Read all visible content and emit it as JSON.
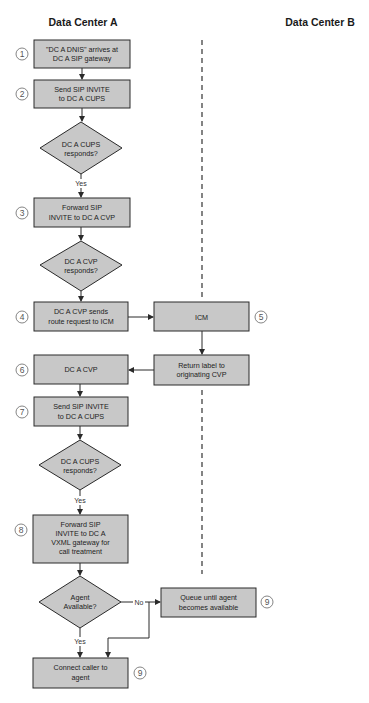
{
  "columns": {
    "left": "Data Center A",
    "right": "Data Center B"
  },
  "steps": [
    {
      "id": "s1",
      "number": "1",
      "type": "process",
      "lines": [
        "\"DC A DNIS\" arrives at",
        "DC A SIP gateway"
      ]
    },
    {
      "id": "s2",
      "number": "2",
      "type": "process",
      "lines": [
        "Send SIP INVITE",
        "to DC A CUPS"
      ]
    },
    {
      "id": "d1",
      "type": "decision",
      "lines": [
        "DC A CUPS",
        "responds?"
      ]
    },
    {
      "id": "s3",
      "number": "3",
      "type": "process",
      "lines": [
        "Forward SIP",
        "INVITE to DC A CVP"
      ]
    },
    {
      "id": "d2",
      "type": "decision",
      "lines": [
        "DC A CVP",
        "responds?"
      ]
    },
    {
      "id": "s4",
      "number": "4",
      "type": "process",
      "lines": [
        "DC A CVP sends",
        "route request to ICM"
      ]
    },
    {
      "id": "s5",
      "number": "5",
      "type": "process",
      "lines": [
        "ICM"
      ]
    },
    {
      "id": "s5b",
      "type": "process",
      "lines": [
        "Return label to",
        "originating CVP"
      ]
    },
    {
      "id": "s6",
      "number": "6",
      "type": "process",
      "lines": [
        "DC A CVP"
      ]
    },
    {
      "id": "s7",
      "number": "7",
      "type": "process",
      "lines": [
        "Send SIP INVITE",
        "to DC A CUPS"
      ]
    },
    {
      "id": "d3",
      "type": "decision",
      "lines": [
        "DC A CUPS",
        "responds?"
      ]
    },
    {
      "id": "s8",
      "number": "8",
      "type": "process",
      "lines": [
        "Forward SIP",
        "INVITE to DC A",
        "VXML gateway for",
        "call treatment"
      ]
    },
    {
      "id": "d4",
      "type": "decision",
      "lines": [
        "Agent",
        "Available?"
      ]
    },
    {
      "id": "s9q",
      "number": "9",
      "type": "process",
      "lines": [
        "Queue until agent",
        "becomes available"
      ]
    },
    {
      "id": "s9c",
      "number": "9",
      "type": "process",
      "lines": [
        "Connect caller to",
        "agent"
      ]
    }
  ],
  "edge_labels": {
    "d1_yes": "Yes",
    "d3_yes": "Yes",
    "d4_yes": "Yes",
    "d4_no": "No"
  },
  "colors": {
    "box_fill": "#c8c8c8",
    "stroke": "#2a2a2a",
    "background": "#ffffff"
  }
}
